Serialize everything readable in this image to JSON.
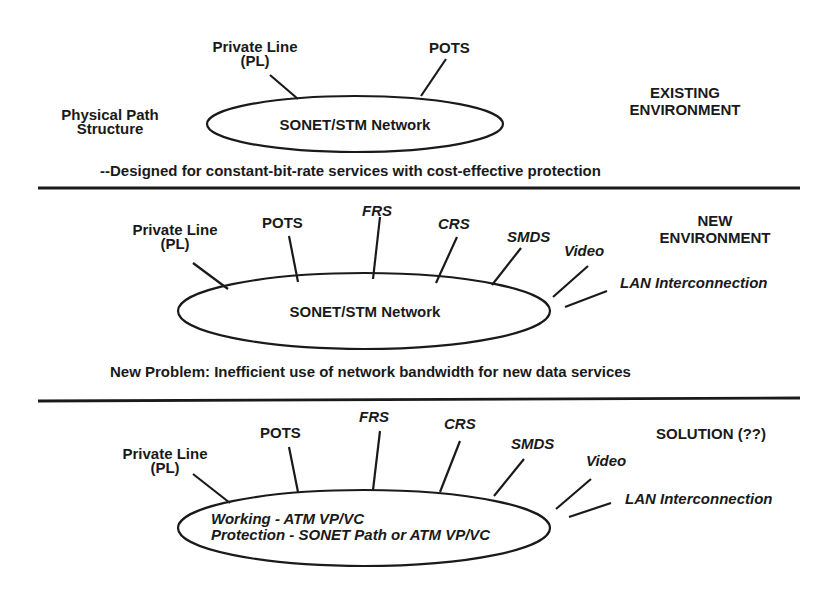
{
  "panels": {
    "existing": {
      "title_line1": "EXISTING",
      "title_line2": "ENVIRONMENT",
      "side_label_line1": "Physical Path",
      "side_label_line2": "Structure",
      "network_label": "SONET/STM Network",
      "services": {
        "pl_line1": "Private Line",
        "pl_line2": "(PL)",
        "pots": "POTS"
      },
      "caption": "--Designed for constant-bit-rate services with cost-effective protection"
    },
    "new": {
      "title_line1": "NEW",
      "title_line2": "ENVIRONMENT",
      "network_label": "SONET/STM Network",
      "services": {
        "pl_line1": "Private Line",
        "pl_line2": "(PL)",
        "pots": "POTS",
        "frs": "FRS",
        "crs": "CRS",
        "smds": "SMDS",
        "video": "Video",
        "lan": "LAN Interconnection"
      },
      "caption": "New Problem:  Inefficient use of network bandwidth for new data services"
    },
    "solution": {
      "title": "SOLUTION (??)",
      "network_line1": "Working - ATM VP/VC",
      "network_line2": "Protection - SONET Path or ATM VP/VC",
      "services": {
        "pl_line1": "Private Line",
        "pl_line2": "(PL)",
        "pots": "POTS",
        "frs": "FRS",
        "crs": "CRS",
        "smds": "SMDS",
        "video": "Video",
        "lan": "LAN Interconnection"
      }
    }
  },
  "colors": {
    "ink": "#1a1a1a",
    "background": "#ffffff"
  }
}
